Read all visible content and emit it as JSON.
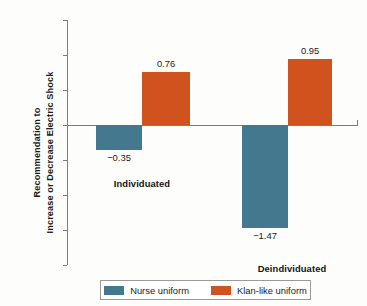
{
  "chart_data": {
    "type": "bar",
    "title": "",
    "subtitle": "",
    "xlabel": "",
    "ylabel": "Recommendation to Increase or Decrease Electric Shock",
    "ylabel_line1": "Recommendation to",
    "ylabel_line2": "Increase or Decrease Electric Shock",
    "categories": [
      "Individuated",
      "Deindividuated"
    ],
    "series": [
      {
        "name": "Nurse uniform",
        "color": "#44788f",
        "values": [
          -0.35,
          -1.47
        ],
        "value_labels": [
          "−0.35",
          "−1.47"
        ]
      },
      {
        "name": "Klan-like uniform",
        "color": "#d0531d",
        "values": [
          0.76,
          0.95
        ],
        "value_labels": [
          "0.76",
          "0.95"
        ]
      }
    ],
    "ylim": [
      -2,
      1.5
    ],
    "ytick_values": [
      1.5,
      1,
      0.5,
      0,
      -0.5,
      -1,
      -1.5,
      -2
    ],
    "ytick_labels": [
      "1.5",
      "1",
      "0.5",
      "0",
      "−0.5",
      "−1",
      "−1.5",
      "−2"
    ],
    "grid": false,
    "legend_position": "bottom",
    "legend_entries": [
      "Nurse uniform",
      "Klan-like uniform"
    ],
    "background_color": "#fdfdfc",
    "axis_color": "#7c7c7c"
  }
}
